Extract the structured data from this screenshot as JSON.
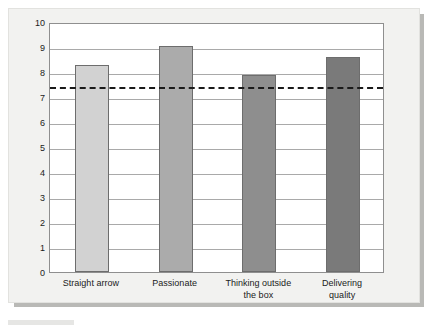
{
  "chart_data": {
    "type": "bar",
    "title": "",
    "subtitle": "",
    "xlabel": "",
    "ylabel": "",
    "categories": [
      "Straight arrow",
      "Passionate",
      "Thinking outside\nthe box",
      "Delivering\nquality"
    ],
    "values": [
      8.3,
      9.05,
      7.9,
      8.6
    ],
    "series": [
      {
        "name": "",
        "values": [
          8.3,
          9.05,
          7.9,
          8.6
        ]
      }
    ],
    "bar_colors": [
      "#d2d2d2",
      "#ababab",
      "#8e8e8e",
      "#7a7a7a"
    ],
    "bar_border_color": "#6d6d6d",
    "ylim": [
      0,
      10
    ],
    "ytick_labels": [
      "10",
      "9",
      "8",
      "7",
      "6",
      "5",
      "4",
      "3",
      "2",
      "1",
      "0"
    ],
    "ytick_values": [
      10,
      9,
      8,
      7,
      6,
      5,
      4,
      3,
      2,
      1,
      0
    ],
    "grid": true,
    "gridline_color": "#a9a9a9",
    "legend": "none",
    "annotations": [
      {
        "name": "reference-line",
        "kind": "horizontal-dashed-line",
        "value": 7.5,
        "color": "#1a1a1a",
        "label": ""
      }
    ],
    "plot_background": "#ffffff",
    "figure_background": "#f2f2f0",
    "axis_color": "#8f8f8f"
  }
}
